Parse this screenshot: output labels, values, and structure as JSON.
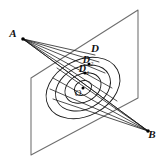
{
  "figure": {
    "type": "geometry-diagram",
    "background_color": "#ffffff",
    "plane": {
      "name": "slanted-plane",
      "stroke_color": "#6e6e6e",
      "corners": [
        {
          "name": "top-right",
          "x": 138,
          "y": 10
        },
        {
          "name": "top-left",
          "x": 31,
          "y": 78
        },
        {
          "name": "bottom-left",
          "x": 31,
          "y": 155
        },
        {
          "name": "bottom-right",
          "x": 138,
          "y": 98
        }
      ]
    },
    "points": [
      {
        "id": "A",
        "label": "A",
        "x": 23,
        "y": 39,
        "label_x": 13,
        "label_y": 37,
        "dot": true
      },
      {
        "id": "B",
        "label": "B",
        "x": 148,
        "y": 131,
        "label_x": 152,
        "label_y": 138,
        "dot": true
      },
      {
        "id": "D",
        "label": "D",
        "x": 95,
        "y": 55,
        "label_x": 95,
        "label_y": 52,
        "dot": false
      },
      {
        "id": "D2",
        "label": "D",
        "sub": "2",
        "x": 89,
        "y": 64,
        "label_x": 88,
        "label_y": 63,
        "dot": true
      },
      {
        "id": "D1",
        "label": "D",
        "sub": "1",
        "x": 85,
        "y": 73,
        "label_x": 84,
        "label_y": 72,
        "dot": true
      },
      {
        "id": "O",
        "label": "O",
        "x": 83,
        "y": 88,
        "label_x": 78,
        "label_y": 96,
        "dot": true
      }
    ],
    "conics": {
      "name": "concentric-ellipse-family",
      "center_x": 83,
      "center_y": 88,
      "rotation_deg": -28,
      "stroke_color": "#1a1a1a",
      "rings": [
        {
          "rx": 9,
          "ry": 7
        },
        {
          "rx": 19,
          "ry": 14
        },
        {
          "rx": 29,
          "ry": 21
        },
        {
          "rx": 39,
          "ry": 28
        }
      ]
    },
    "rays_from_a": [
      {
        "to_x": 148,
        "to_y": 131,
        "dashed": false
      },
      {
        "to_x": 117,
        "to_y": 101,
        "dashed": false
      },
      {
        "to_x": 112,
        "to_y": 88,
        "dashed": false
      },
      {
        "to_x": 105,
        "to_y": 73,
        "dashed": false
      },
      {
        "to_x": 99,
        "to_y": 62,
        "dashed": false
      },
      {
        "to_x": 95,
        "to_y": 55,
        "dashed": false
      }
    ],
    "rays_from_b": [
      {
        "to_x": 23,
        "to_y": 39,
        "dashed": false
      },
      {
        "to_x": 57,
        "to_y": 68,
        "dashed": false
      },
      {
        "to_x": 53,
        "to_y": 78,
        "dashed": false
      },
      {
        "to_x": 50,
        "to_y": 89,
        "dashed": false
      },
      {
        "to_x": 53,
        "to_y": 99,
        "dashed": false
      }
    ]
  }
}
